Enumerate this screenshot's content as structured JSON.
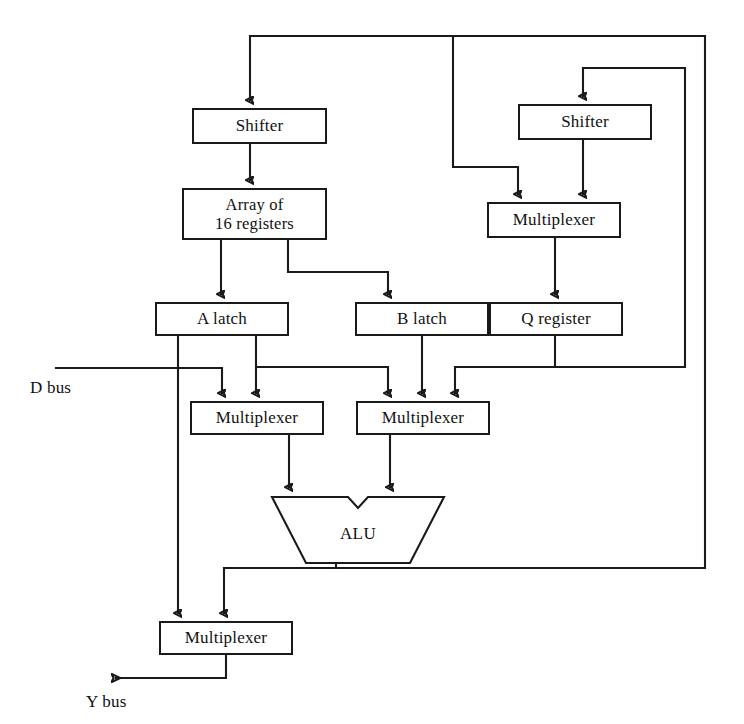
{
  "diagram": {
    "canvas": {
      "width": 744,
      "height": 724
    },
    "stroke_color": "#1a1a1a",
    "background_color": "#ffffff",
    "blocks": [
      {
        "id": "shifter-left",
        "label": "Shifter",
        "x": 192,
        "y": 108,
        "w": 135,
        "h": 36
      },
      {
        "id": "register-array",
        "label": "Array of\n16 registers",
        "label_line1": "Array of",
        "label_line2": "16 registers",
        "x": 182,
        "y": 188,
        "w": 145,
        "h": 52
      },
      {
        "id": "shifter-right",
        "label": "Shifter",
        "x": 518,
        "y": 104,
        "w": 134,
        "h": 36
      },
      {
        "id": "multiplexer-q",
        "label": "Multiplexer",
        "x": 487,
        "y": 202,
        "w": 134,
        "h": 36
      },
      {
        "id": "a-latch",
        "label": "A latch",
        "x": 155,
        "y": 302,
        "w": 134,
        "h": 34
      },
      {
        "id": "b-latch",
        "label": "B latch",
        "x": 355,
        "y": 302,
        "w": 134,
        "h": 34
      },
      {
        "id": "q-register",
        "label": "Q register",
        "x": 489,
        "y": 302,
        "w": 134,
        "h": 34
      },
      {
        "id": "multiplexer-a",
        "label": "Multiplexer",
        "x": 190,
        "y": 401,
        "w": 134,
        "h": 34
      },
      {
        "id": "multiplexer-b",
        "label": "Multiplexer",
        "x": 356,
        "y": 401,
        "w": 134,
        "h": 34
      },
      {
        "id": "alu",
        "label": "ALU",
        "x": 270,
        "y": 495,
        "w": 176,
        "h": 70,
        "shape": "alu-trapezoid"
      },
      {
        "id": "multiplexer-out",
        "label": "Multiplexer",
        "x": 159,
        "y": 621,
        "w": 134,
        "h": 34
      }
    ],
    "bus_labels": [
      {
        "id": "d-bus",
        "label": "D bus",
        "x": 30,
        "y": 378
      },
      {
        "id": "y-bus",
        "label": "Y bus",
        "x": 86,
        "y": 692
      }
    ]
  }
}
